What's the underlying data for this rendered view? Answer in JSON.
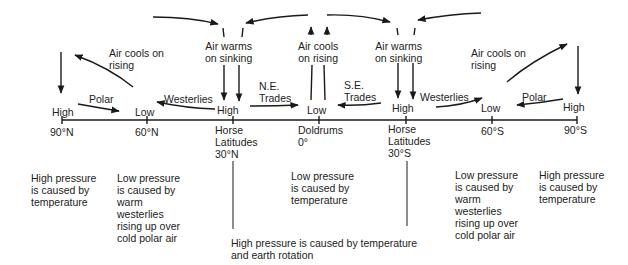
{
  "diagram": {
    "type": "global atmospheric circulation cross-section",
    "pressure_belts": [
      {
        "pressure": "High",
        "latitude": "90°N",
        "name": ""
      },
      {
        "pressure": "Low",
        "latitude": "60°N",
        "name": ""
      },
      {
        "pressure": "High",
        "latitude": "30°N",
        "name": "Horse Latitudes"
      },
      {
        "pressure": "Low",
        "latitude": "0°",
        "name": "Doldrums"
      },
      {
        "pressure": "High",
        "latitude": "30°S",
        "name": "Horse Latitudes"
      },
      {
        "pressure": "Low",
        "latitude": "60°S",
        "name": ""
      },
      {
        "pressure": "High",
        "latitude": "90°S",
        "name": ""
      }
    ],
    "winds": {
      "polar_n": "Polar",
      "westerlies_n": "Westerlies",
      "ne_trades_1": "N.E.",
      "ne_trades_2": "Trades",
      "se_trades_1": "S.E.",
      "se_trades_2": "Trades",
      "westerlies_s": "Westerlies",
      "polar_s": "Polar"
    },
    "vertical_labels": {
      "cools_n_1": "Air cools on",
      "cools_n_2": "rising",
      "warms_n_1": "Air warms",
      "warms_n_2": "on sinking",
      "cools_eq_1": "Air cools",
      "cools_eq_2": "on rising",
      "warms_s_1": "Air warms",
      "warms_s_2": "on sinking",
      "cools_s_1": "Air cools on",
      "cools_s_2": "rising"
    },
    "axis": {
      "high_90n": "High",
      "low_60n": "Low",
      "high_30n": "High",
      "low_0": "Low",
      "high_30s": "High",
      "low_60s": "Low",
      "high_90s": "High",
      "lat_90n": "90°N",
      "lat_60n": "60°N",
      "horse_n_1": "Horse",
      "horse_n_2": "Latitudes",
      "lat_30n": "30°N",
      "doldrums": "Doldrums",
      "lat_0": "0°",
      "horse_s_1": "Horse",
      "horse_s_2": "Latitudes",
      "lat_30s": "30°S",
      "lat_60s": "60°S",
      "lat_90s": "90°S"
    },
    "explanations": {
      "pole_n": "High pressure\nis caused by\ntemperature",
      "subpolar_n": "Low pressure\nis caused by\nwarm\nwesterlies\nrising up over\ncold polar air",
      "equator": "Low pressure\nis caused by\ntemperature",
      "horse_latitudes": "High pressure is caused by temperature\nand earth rotation",
      "subpolar_s": "Low pressure\nis caused by\nwarm\nwesterlies\nrising up over\ncold polar air",
      "pole_s": "High pressure\nis caused by\ntemperature"
    }
  }
}
